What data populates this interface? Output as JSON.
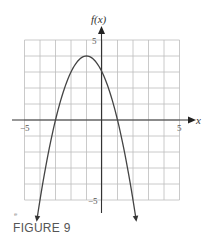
{
  "chart_data": {
    "type": "line",
    "title": "",
    "xlabel": "x",
    "ylabel": "f(x)",
    "xlim": [
      -5,
      5
    ],
    "ylim": [
      -5,
      5
    ],
    "grid": true,
    "x_ticks_labeled": [
      -5,
      5
    ],
    "y_ticks_labeled": [
      5,
      -5
    ],
    "series": [
      {
        "name": "f(x)",
        "function": "-(x+1)^2 + 4",
        "vertex": [
          -1,
          4
        ],
        "roots": [
          -3,
          1
        ],
        "y_intercept": 3,
        "x": [
          -4.2,
          -4,
          -3,
          -2,
          -1,
          0,
          1,
          2,
          2.2
        ],
        "values": [
          -6.24,
          -5,
          0,
          3,
          4,
          3,
          0,
          -5,
          -6.24
        ],
        "arrows_at_ends": true
      }
    ]
  },
  "labels": {
    "y_axis": "f(x)",
    "x_axis": "x",
    "x_min": "−5",
    "x_max": "5",
    "y_max": "5",
    "y_min": "−5"
  },
  "caption": {
    "mark": "e",
    "text": "FIGURE 9"
  },
  "colors": {
    "grid": "#bdbdbd",
    "axis": "#333333",
    "curve": "#444444",
    "caption": "#555555"
  }
}
